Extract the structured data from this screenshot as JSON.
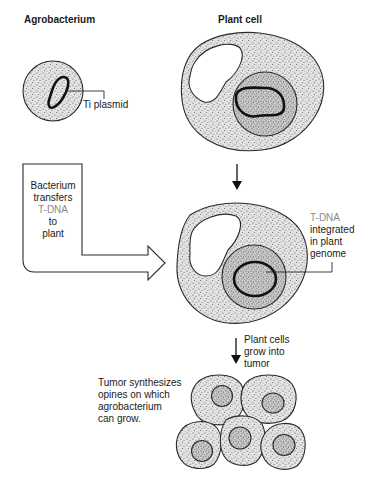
{
  "titles": {
    "agrobacterium": "Agrobacterium",
    "plant_cell": "Plant cell"
  },
  "labels": {
    "ti_plasmid": "Ti plasmid",
    "transfer": [
      "Bacterium",
      "transfers",
      "T-DNA",
      "to",
      "plant"
    ],
    "integrated": [
      "T-DNA",
      "integrated",
      "in plant",
      "genome"
    ],
    "grow": [
      "Plant cells",
      "grow into",
      "tumor"
    ],
    "tumor": [
      "Tumor synthesizes",
      "opines on which",
      "agrobacterium",
      "can grow."
    ]
  },
  "highlight_terms": [
    "T-DNA"
  ],
  "colors": {
    "text": "#1a1a1a",
    "highlight_text": "#8a8a8a",
    "cytoplasm": "#d8d8d8",
    "nucleus": "#bdbdbd",
    "outline": "#2a2a2a"
  },
  "stages": [
    {
      "id": "bacterium",
      "name": "Agrobacterium with Ti plasmid"
    },
    {
      "id": "plant-cell",
      "name": "Plant cell"
    },
    {
      "id": "transformed-cell",
      "name": "Plant cell with integrated T-DNA"
    },
    {
      "id": "tumor",
      "name": "Tumor cell cluster",
      "cell_count": 5
    }
  ]
}
